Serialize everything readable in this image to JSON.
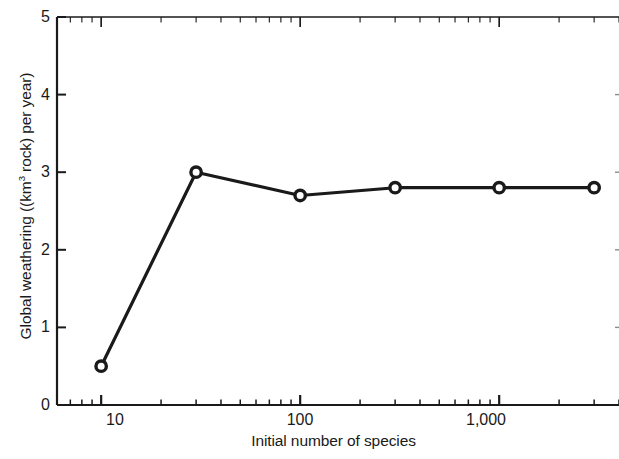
{
  "chart_data": {
    "type": "line",
    "title": "",
    "xlabel": "Initial number of species",
    "ylabel": "Global weathering ((km³ rock) per year)",
    "ylabel_parts": {
      "before": "Global weathering ((km",
      "sup": "3",
      "after": " rock) per year)"
    },
    "xscale": "log",
    "yscale": "linear",
    "xlim": [
      6,
      4000
    ],
    "ylim": [
      0,
      5
    ],
    "grid": false,
    "legend": null,
    "x": [
      10,
      30,
      100,
      300,
      1000,
      3000
    ],
    "values": [
      0.5,
      3.0,
      2.7,
      2.8,
      2.8,
      2.8
    ],
    "series": [
      {
        "name": "Global weathering",
        "x": [
          10,
          30,
          100,
          300,
          1000,
          3000
        ],
        "values": [
          0.5,
          3.0,
          2.7,
          2.8,
          2.8,
          2.8
        ],
        "marker": "open-circle",
        "color": "#1a1a1a"
      }
    ],
    "ytick_labels": [
      "0",
      "1",
      "2",
      "3",
      "4",
      "5"
    ],
    "ytick_values": [
      0,
      1,
      2,
      3,
      4,
      5
    ],
    "xtick_labels": [
      "10",
      "100",
      "1,000"
    ],
    "xtick_values": [
      10,
      100,
      1000
    ]
  },
  "axes": {
    "y_title": "Global weathering ((km3 rock) per year)",
    "x_title": "Initial number of species"
  },
  "colors": {
    "line": "#1a1a1a",
    "axis": "#1a1a1a",
    "background": "#ffffff"
  }
}
